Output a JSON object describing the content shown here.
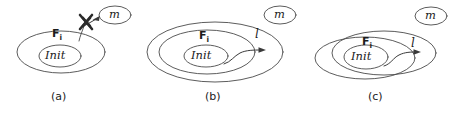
{
  "figure": {
    "kind": "set-containment-diagram",
    "background_color": "#ffffff",
    "line_color": "#4a4a4a",
    "text_color": "#1c1c1c",
    "panel_count": 3
  },
  "panels": [
    {
      "id": "a",
      "caption": "(a)",
      "fi_label": "F",
      "fi_subscript": "i",
      "init_label": "Init",
      "message_label": "m",
      "has_l_label": false,
      "l_label": "",
      "has_cross": true,
      "arrow_description": "blocked-incoming-message-arrow"
    },
    {
      "id": "b",
      "caption": "(b)",
      "fi_label": "F",
      "fi_subscript": "i",
      "init_label": "Init",
      "message_label": "m",
      "has_l_label": true,
      "l_label": "l",
      "has_cross": false,
      "arrow_description": "outgoing-arrow-crossing-fi-boundary"
    },
    {
      "id": "c",
      "caption": "(c)",
      "fi_label": "F",
      "fi_subscript": "i",
      "init_label": "Init",
      "message_label": "m",
      "has_l_label": true,
      "l_label": "l",
      "has_cross": false,
      "arrow_description": "outgoing-arrow-into-overlap-region"
    }
  ]
}
